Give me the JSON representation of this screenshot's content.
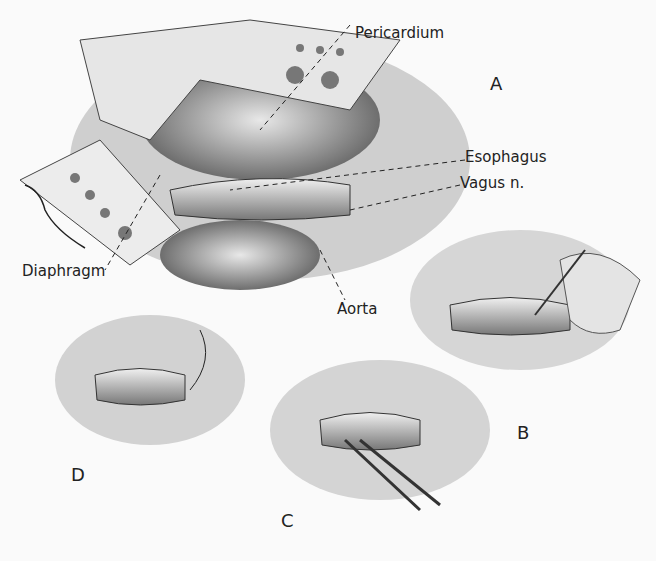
{
  "figure": {
    "labels": {
      "pericardium": "Pericardium",
      "esophagus": "Esophagus",
      "vagus": "Vagus n.",
      "diaphragm": "Diaphragm",
      "aorta": "Aorta"
    },
    "panels": {
      "a": "A",
      "b": "B",
      "c": "C",
      "d": "D"
    },
    "signature": "D. Lee"
  }
}
